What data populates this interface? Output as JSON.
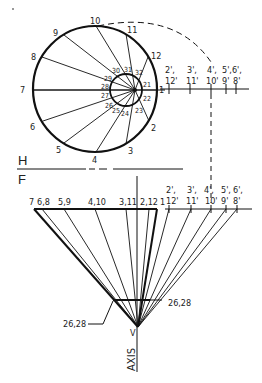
{
  "drawing": {
    "title": "Development of oblique cone (top & front views)",
    "view_labels": {
      "top": "H",
      "front": "F"
    },
    "axis_label": "AXIS",
    "apex_label": "V",
    "top_view": {
      "outer_points": [
        "1",
        "2",
        "3",
        "4",
        "5",
        "6",
        "7",
        "8",
        "9",
        "10",
        "11",
        "12"
      ],
      "inner_points": [
        "21",
        "22",
        "23",
        "24",
        "25",
        "26",
        "27",
        "28",
        "29",
        "30",
        "31",
        "32"
      ],
      "true_length_labels_top": [
        "2',",
        "3',",
        "4',",
        "5',6',"
      ],
      "true_length_labels_bottom": [
        "12'",
        "11'",
        "10'",
        "9'",
        "8'"
      ]
    },
    "front_view": {
      "base_labels": [
        "7",
        "6,8",
        "5,9",
        "4,10",
        "3,11",
        "2,12",
        "1"
      ],
      "true_length_labels_top": [
        "2',",
        "3',",
        "4',",
        "5',",
        "6',"
      ],
      "true_length_labels_bottom": [
        "12'",
        "11'",
        "10'",
        "9'",
        "8'"
      ],
      "section_label_left": "26,28",
      "section_label_right": "26,28"
    }
  }
}
